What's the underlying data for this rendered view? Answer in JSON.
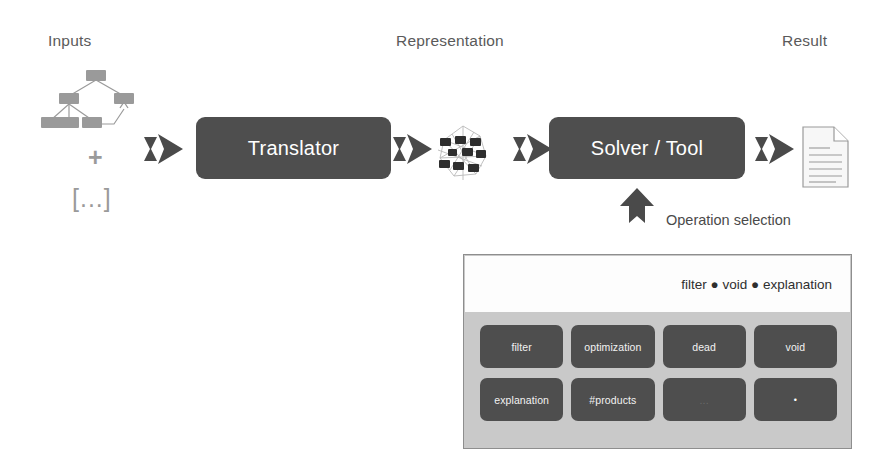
{
  "headings": {
    "inputs": "Inputs",
    "representation": "Representation",
    "result": "Result"
  },
  "pipeline": {
    "input_plus": "+",
    "input_ellipsis": "[...]",
    "translator_label": "Translator",
    "solver_label": "Solver / Tool",
    "representation_icon": "graph-network-icon",
    "result_icon": "document-icon",
    "arrow_icon": "arrow-right-icon"
  },
  "operation_selection": {
    "callout_label": "Operation selection",
    "callout_icon": "arrow-up-icon",
    "breadcrumb": {
      "items": [
        "filter",
        "void",
        "explanation"
      ],
      "separator": "●",
      "text": "filter ● void ● explanation"
    },
    "tiles": [
      {
        "label": "filter",
        "style": "normal"
      },
      {
        "label": "optimization",
        "style": "normal"
      },
      {
        "label": "dead",
        "style": "normal"
      },
      {
        "label": "void",
        "style": "normal"
      },
      {
        "label": "explanation",
        "style": "normal"
      },
      {
        "label": "#products",
        "style": "normal"
      },
      {
        "label": "...",
        "style": "faint"
      },
      {
        "label": "•",
        "style": "dot-only"
      }
    ]
  },
  "colors": {
    "box_fill": "#4e4e4e",
    "box_text": "#ffffff",
    "panel_bg": "#c9c9c9",
    "panel_border": "#8e8e8e",
    "panel_header_bg": "#fdfdfd",
    "tree_node": "#9a9a9a",
    "heading_text": "#5a5a5a",
    "arrow_fill": "#4a4a4a"
  }
}
